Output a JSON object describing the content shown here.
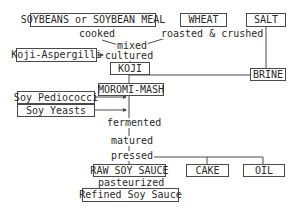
{
  "diagram": {
    "nodes": {
      "soybeans": "SOYBEANS or SOYBEAN MEAL",
      "wheat": "WHEAT",
      "salt": "SALT",
      "koji_aspergilli": "Koji-Aspergilli",
      "koji": "KOJI",
      "brine": "BRINE",
      "moromi_mash": "MOROMI-MASH",
      "soy_pediococci": "Soy Pediococci",
      "soy_yeasts": "Soy Yeasts",
      "raw_soy_sauce": "RAW SOY SAUCE",
      "cake": "CAKE",
      "oil": "OIL",
      "refined_soy_sauce": "Refined Soy Sauce"
    },
    "steps": {
      "cooked": "cooked",
      "roasted_crushed": "roasted & crushed",
      "mixed": "mixed",
      "cultured": "cultured",
      "fermented": "fermented",
      "matured": "matured",
      "pressed": "pressed",
      "pasteurized": "pasteurized"
    },
    "colors": {
      "line": "#4a4a4a",
      "text": "#2a2a2a",
      "background": "#ffffff"
    }
  }
}
